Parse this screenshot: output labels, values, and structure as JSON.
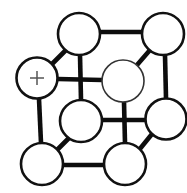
{
  "figure": {
    "kind": "crystal-lattice-unit-cell-diagram",
    "background_color": "#ffffff",
    "bond_color": "#0d0d0d",
    "atom_fill_color": "#ffffff",
    "atom_outline_color": "#111111",
    "marker_color": "#555555",
    "width": 187,
    "height": 193
  },
  "chart_data": {
    "type": "diagram",
    "title": "",
    "atoms": [
      {
        "id": "back-top-left",
        "cx": 79,
        "cy": 34,
        "r": 21,
        "stroke": "thick",
        "marker": ""
      },
      {
        "id": "back-top-right",
        "cx": 163,
        "cy": 34,
        "r": 21,
        "stroke": "thick",
        "marker": ""
      },
      {
        "id": "front-top-left",
        "cx": 37,
        "cy": 78,
        "r": 20.5,
        "stroke": "thick",
        "marker": "+"
      },
      {
        "id": "center-face",
        "cx": 123,
        "cy": 81,
        "r": 21,
        "stroke": "thin",
        "marker": ""
      },
      {
        "id": "back-bottom-left",
        "cx": 81,
        "cy": 121,
        "r": 21,
        "stroke": "thick",
        "marker": ""
      },
      {
        "id": "back-bottom-right",
        "cx": 166,
        "cy": 119,
        "r": 20.5,
        "stroke": "thick",
        "marker": ""
      },
      {
        "id": "front-bottom-left",
        "cx": 42,
        "cy": 164,
        "r": 21,
        "stroke": "thick",
        "marker": ""
      },
      {
        "id": "front-bottom-right",
        "cx": 125,
        "cy": 164,
        "r": 21,
        "stroke": "thick",
        "marker": ""
      }
    ],
    "bonds": [
      {
        "from": "back-top-left",
        "to": "back-top-right",
        "x1": 100,
        "y1": 32,
        "x2": 142,
        "y2": 32
      },
      {
        "from": "front-top-left",
        "to": "back-top-left",
        "x1": 52,
        "y1": 64,
        "x2": 66,
        "y2": 50
      },
      {
        "from": "back-top-right",
        "to": "center-face",
        "x1": 150,
        "y1": 50,
        "x2": 137,
        "y2": 65
      },
      {
        "from": "front-top-left",
        "to": "center-face",
        "x1": 58,
        "y1": 79,
        "x2": 102,
        "y2": 80
      },
      {
        "from": "back-top-left",
        "to": "back-bottom-left",
        "x1": 80,
        "y1": 55,
        "x2": 81,
        "y2": 100
      },
      {
        "from": "back-top-right",
        "to": "back-bottom-right",
        "x1": 165,
        "y1": 55,
        "x2": 166,
        "y2": 98
      },
      {
        "from": "front-top-left",
        "to": "front-bottom-left",
        "x1": 39,
        "y1": 99,
        "x2": 41,
        "y2": 143
      },
      {
        "from": "center-face",
        "to": "front-bottom-right",
        "x1": 124,
        "y1": 102,
        "x2": 125,
        "y2": 143
      },
      {
        "from": "back-bottom-left",
        "to": "back-bottom-right",
        "x1": 102,
        "y1": 120,
        "x2": 146,
        "y2": 120
      },
      {
        "from": "front-bottom-left",
        "to": "back-bottom-left",
        "x1": 57,
        "y1": 150,
        "x2": 70,
        "y2": 137
      },
      {
        "from": "back-bottom-right",
        "to": "front-bottom-right",
        "x1": 152,
        "y1": 134,
        "x2": 139,
        "y2": 150
      },
      {
        "from": "front-bottom-left",
        "to": "front-bottom-right",
        "x1": 63,
        "y1": 165,
        "x2": 104,
        "y2": 165
      }
    ],
    "markers": [
      {
        "atom": "front-top-left",
        "symbol": "+",
        "cx": 37,
        "cy": 78,
        "size": 14
      }
    ]
  }
}
